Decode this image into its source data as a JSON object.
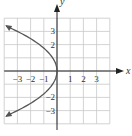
{
  "chart_data": {
    "type": "line",
    "title": "",
    "xlabel": "x",
    "ylabel": "y",
    "xlim": [
      -4,
      4
    ],
    "ylim": [
      -4,
      4
    ],
    "grid": true,
    "x_ticks": [
      -3,
      -2,
      -1,
      1,
      2,
      3
    ],
    "y_ticks": [
      3,
      2,
      -2,
      -3
    ],
    "x_tick_labels": [
      "−3",
      "−2",
      "−1",
      "1",
      "2",
      "3"
    ],
    "y_tick_labels": [
      "3",
      "2",
      "−2",
      "−3"
    ],
    "series": [
      {
        "name": "curve",
        "description": "Leftward-opening parabola with vertex at origin, arrows at both ends",
        "equation": "x = -y^2/3",
        "points": [
          {
            "x": -3.85,
            "y": 3.4
          },
          {
            "x": -3,
            "y": 3
          },
          {
            "x": -1.33,
            "y": 2
          },
          {
            "x": -0.33,
            "y": 1
          },
          {
            "x": 0,
            "y": 0
          },
          {
            "x": -0.33,
            "y": -1
          },
          {
            "x": -1.33,
            "y": -2
          },
          {
            "x": -3,
            "y": -3
          },
          {
            "x": -3.85,
            "y": -3.4
          }
        ]
      }
    ],
    "colors": {
      "curve": "#555555",
      "grid": "#cccccc",
      "axis": "#222222"
    }
  }
}
